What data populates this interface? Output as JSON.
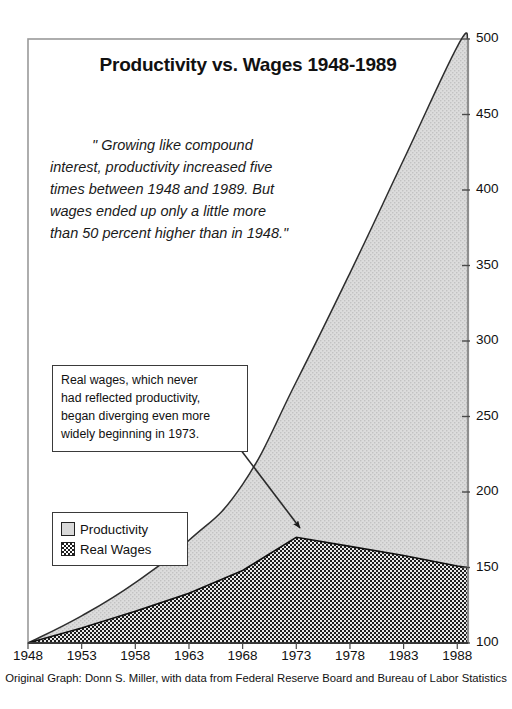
{
  "title": "Productivity vs. Wages 1948-1989",
  "quote": {
    "lines": [
      "\" Growing like compound",
      "interest, productivity increased five",
      "times between 1948 and 1989. But",
      "wages ended up only a little more",
      "than 50 percent higher than in 1948.\""
    ]
  },
  "annotation": {
    "lines": [
      "Real wages, which never",
      "had reflected productivity,",
      "began diverging even more",
      "widely beginning in 1973."
    ]
  },
  "legend": {
    "items": [
      {
        "label": "Productivity",
        "swatch": "light-gray-dotted",
        "color": "#d9d9d9"
      },
      {
        "label": "Real Wages",
        "swatch": "dark-checkered",
        "color": "#1e1e1e"
      }
    ]
  },
  "caption": "Original Graph: Donn S. Miller, with data from Federal Reserve Board and Bureau of Labor Statistics",
  "axes": {
    "y_ticks": [
      "500",
      "450",
      "400",
      "350",
      "300",
      "250",
      "200",
      "150",
      "100"
    ],
    "x_ticks": [
      "1948",
      "1953",
      "1958",
      "1963",
      "1968",
      "1973",
      "1978",
      "1983",
      "1988"
    ]
  },
  "chart_data": {
    "type": "area",
    "title": "Productivity vs. Wages 1948-1989",
    "xlabel": "",
    "ylabel": "",
    "xlim": [
      1948,
      1989
    ],
    "ylim": [
      100,
      500
    ],
    "grid": false,
    "legend_position": "inside-left",
    "x": [
      1948,
      1953,
      1958,
      1963,
      1968,
      1973,
      1978,
      1983,
      1988,
      1989
    ],
    "series": [
      {
        "name": "Productivity",
        "values": [
          100,
          118,
          140,
          168,
          205,
          273,
          345,
          420,
          495,
          500
        ],
        "fill": "#d9d9d9"
      },
      {
        "name": "Real Wages",
        "values": [
          100,
          110,
          121,
          133,
          148,
          170,
          164,
          158,
          151,
          150
        ],
        "fill": "#1e1e1e"
      }
    ],
    "annotations": [
      {
        "text": "Real wages, which never had reflected productivity, began diverging even more widely beginning in 1973.",
        "points_to_year": 1973
      },
      {
        "text": "\" Growing like compound interest, productivity increased five times between 1948 and 1989. But wages ended up only a little more than 50 percent higher than in 1948.\""
      }
    ]
  }
}
